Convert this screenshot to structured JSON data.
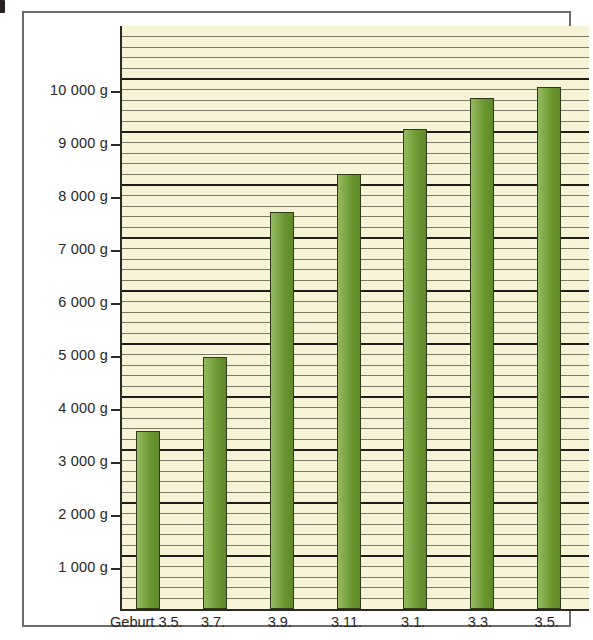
{
  "figure": {
    "corner_mark": "",
    "background_color": "#f6f3d7",
    "bar_color": "#76a633",
    "frame_color": "#6e6b68",
    "axis_color": "#2b2a26"
  },
  "chart_data": {
    "type": "bar",
    "title": "",
    "subtitle": "",
    "xlabel": "",
    "ylabel": "",
    "categories": [
      "Geburt 3.5.",
      "3.7.",
      "3.9.",
      "3.11.",
      "3.1.",
      "3.3.",
      "3.5."
    ],
    "values": [
      3350,
      4750,
      7500,
      8200,
      9050,
      9650,
      9850
    ],
    "unit": "g",
    "ylim": [
      0,
      11000
    ],
    "ytick_values": [
      1000,
      2000,
      3000,
      4000,
      5000,
      6000,
      7000,
      8000,
      9000,
      10000
    ],
    "ytick_labels": [
      "1 000 g",
      "2 000 g",
      "3 000 g",
      "4 000 g",
      "5 000 g",
      "6 000 g",
      "7 000 g",
      "8 000 g",
      "9 000 g",
      "10 000 g"
    ],
    "grid": {
      "major_step": 1000,
      "minor_step": 200,
      "horizontal": true,
      "vertical": false
    },
    "legend": {
      "entries": [],
      "position": "none"
    },
    "annotations": []
  }
}
